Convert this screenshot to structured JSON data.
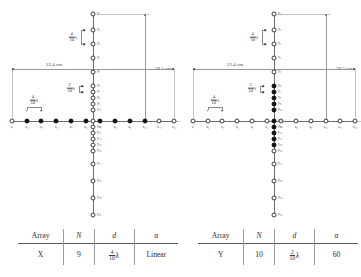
{
  "figure": {
    "panels": [
      {
        "id": "panel-x",
        "array_label": "X",
        "h_dimension": "22.4 cm",
        "v_dimension": "28.5 cm",
        "spacing_upper_vertical": {
          "num": "4",
          "den": "10",
          "symbol": "λ"
        },
        "spacing_horizontal_wide": {
          "num": "4",
          "den": "10",
          "symbol": "λ"
        },
        "spacing_horizontal_narrow": {
          "num": "2",
          "den": "10",
          "symbol": "λ"
        },
        "x_nodes": [
          {
            "label": "x₁",
            "filled": false
          },
          {
            "label": "x₂",
            "filled": true
          },
          {
            "label": "x₃",
            "filled": true
          },
          {
            "label": "x₄",
            "filled": true
          },
          {
            "label": "x₅",
            "filled": true
          },
          {
            "label": "x₆",
            "filled": true
          },
          {
            "label": "x₇",
            "filled": true
          },
          {
            "label": "x₈",
            "filled": true
          },
          {
            "label": "x₉",
            "filled": true
          },
          {
            "label": "x₁₀",
            "filled": true
          },
          {
            "label": "x₁₁",
            "filled": false
          },
          {
            "label": "x₁₂",
            "filled": false
          }
        ],
        "y_nodes": [
          {
            "label": "y₁",
            "filled": false
          },
          {
            "label": "y₂",
            "filled": false
          },
          {
            "label": "y₃",
            "filled": false
          },
          {
            "label": "y₄",
            "filled": false
          },
          {
            "label": "y₅",
            "filled": false
          },
          {
            "label": "y₆",
            "filled": false
          },
          {
            "label": "y₇",
            "filled": false
          },
          {
            "label": "y₈",
            "filled": false
          },
          {
            "label": "y₉",
            "filled": false
          },
          {
            "label": "y₁₀",
            "filled": false
          },
          {
            "label": "y₁₁",
            "filled": false
          },
          {
            "label": "y₁₂",
            "filled": false
          },
          {
            "label": "y₁₃",
            "filled": false
          },
          {
            "label": "y₁₄",
            "filled": false
          },
          {
            "label": "y₁₅",
            "filled": false
          },
          {
            "label": "y₁₆",
            "filled": false
          },
          {
            "label": "y₁₇",
            "filled": false
          },
          {
            "label": "y₁₈",
            "filled": false
          },
          {
            "label": "y₁₉",
            "filled": false
          },
          {
            "label": "y₂₀",
            "filled": false
          }
        ]
      },
      {
        "id": "panel-y",
        "array_label": "Y",
        "h_dimension": "22.4 cm",
        "v_dimension": "28.5 cm",
        "spacing_upper_vertical": {
          "num": "4",
          "den": "10",
          "symbol": "λ"
        },
        "spacing_horizontal_wide": {
          "num": "4",
          "den": "10",
          "symbol": "λ"
        },
        "spacing_horizontal_narrow": {
          "num": "2",
          "den": "10",
          "symbol": "λ"
        },
        "x_nodes": [
          {
            "label": "x₁",
            "filled": false
          },
          {
            "label": "x₂",
            "filled": false
          },
          {
            "label": "x₃",
            "filled": false
          },
          {
            "label": "x₄",
            "filled": false
          },
          {
            "label": "x₅",
            "filled": false
          },
          {
            "label": "x₆",
            "filled": false
          },
          {
            "label": "x₇",
            "filled": false
          },
          {
            "label": "x₈",
            "filled": false
          },
          {
            "label": "x₉",
            "filled": false
          },
          {
            "label": "x₁₀",
            "filled": false
          },
          {
            "label": "x₁₁",
            "filled": false
          },
          {
            "label": "x₁₂",
            "filled": false
          }
        ],
        "y_nodes": [
          {
            "label": "y₁",
            "filled": false
          },
          {
            "label": "y₂",
            "filled": false
          },
          {
            "label": "y₃",
            "filled": false
          },
          {
            "label": "y₄",
            "filled": false
          },
          {
            "label": "y₅",
            "filled": false
          },
          {
            "label": "y₆",
            "filled": true
          },
          {
            "label": "y₇",
            "filled": true
          },
          {
            "label": "y₈",
            "filled": true
          },
          {
            "label": "y₉",
            "filled": true
          },
          {
            "label": "y₁₀",
            "filled": true
          },
          {
            "label": "y₁₁",
            "filled": true
          },
          {
            "label": "y₁₂",
            "filled": true
          },
          {
            "label": "y₁₃",
            "filled": true
          },
          {
            "label": "y₁₄",
            "filled": true
          },
          {
            "label": "y₁₅",
            "filled": true
          },
          {
            "label": "y₁₆",
            "filled": false
          },
          {
            "label": "y₁₇",
            "filled": false
          },
          {
            "label": "y₁₈",
            "filled": false
          },
          {
            "label": "y₁₉",
            "filled": false
          },
          {
            "label": "y₂₀",
            "filled": false
          }
        ]
      }
    ]
  },
  "tables": [
    {
      "id": "table-x",
      "headers": [
        "Array",
        "N",
        "d",
        "α"
      ],
      "row": {
        "array": "X",
        "n": "9",
        "d_num": "4",
        "d_den": "10",
        "d_symbol": "λ",
        "alpha": "Linear"
      }
    },
    {
      "id": "table-y",
      "headers": [
        "Array",
        "N",
        "d",
        "α"
      ],
      "row": {
        "array": "Y",
        "n": "10",
        "d_num": "2",
        "d_den": "10",
        "d_symbol": "λ",
        "alpha": "60"
      }
    }
  ]
}
